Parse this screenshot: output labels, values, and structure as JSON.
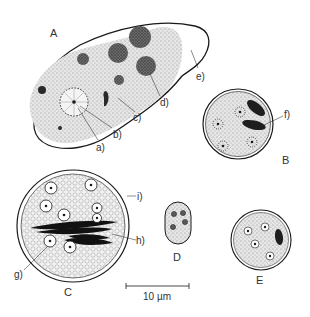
{
  "figure": {
    "panels": {
      "A": "A",
      "B": "B",
      "C": "C",
      "D": "D",
      "E": "E"
    },
    "annotations": {
      "a": "a)",
      "b": "b)",
      "c": "c)",
      "d": "d)",
      "e": "e)",
      "f": "f)",
      "g": "g)",
      "h": "h)",
      "i": "i)"
    },
    "scale_bar": {
      "label": "10 µm"
    },
    "colors": {
      "ink": "#1a1a1a",
      "stipple": "#c8c8c8",
      "dark_body": "#2a2a2a",
      "background": "#ffffff"
    }
  }
}
